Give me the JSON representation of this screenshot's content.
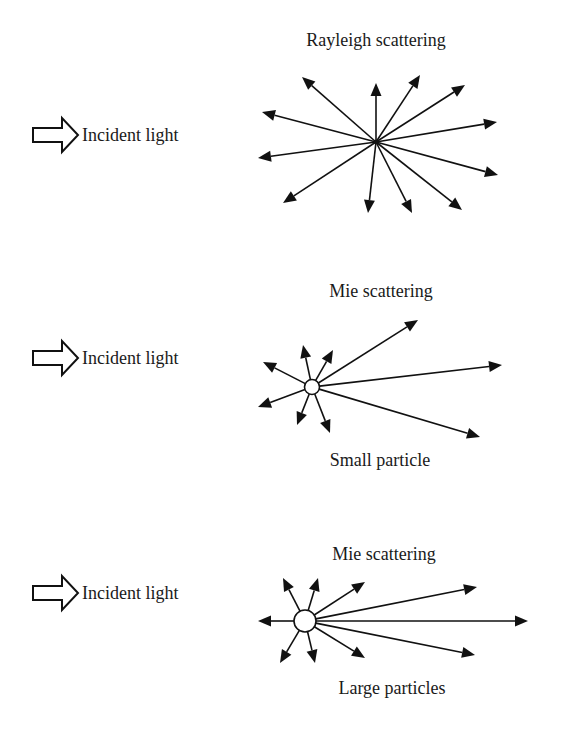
{
  "panels": [
    {
      "id": "rayleigh",
      "title": "Rayleigh scattering",
      "caption": "",
      "incident_label": "Incident light",
      "incident_icon": "hollow-right-arrow-icon",
      "incident_y": 135,
      "title_pos": [
        376,
        46
      ],
      "caption_pos": null,
      "center": [
        376,
        142
      ],
      "particle_radius": 0,
      "arrows": [
        [
          302,
          77
        ],
        [
          376,
          83
        ],
        [
          420,
          75
        ],
        [
          465,
          85
        ],
        [
          262,
          112
        ],
        [
          497,
          122
        ],
        [
          258,
          158
        ],
        [
          498,
          175
        ],
        [
          283,
          203
        ],
        [
          368,
          213
        ],
        [
          412,
          213
        ],
        [
          462,
          210
        ]
      ]
    },
    {
      "id": "mie-small",
      "title": "Mie scattering",
      "caption": "Small particle",
      "incident_label": "Incident light",
      "incident_icon": "hollow-right-arrow-icon",
      "incident_y": 358,
      "title_pos": [
        381,
        297
      ],
      "caption_pos": [
        380,
        466
      ],
      "center": [
        312,
        387
      ],
      "particle_radius": 7.5,
      "arrows": [
        [
          263,
          362
        ],
        [
          303,
          345
        ],
        [
          333,
          350
        ],
        [
          418,
          320
        ],
        [
          502,
          365
        ],
        [
          480,
          437
        ],
        [
          258,
          407
        ],
        [
          297,
          425
        ],
        [
          330,
          433
        ]
      ]
    },
    {
      "id": "mie-large",
      "title": "Mie scattering",
      "caption": "Large particles",
      "incident_label": "Incident light",
      "incident_icon": "hollow-right-arrow-icon",
      "incident_y": 593,
      "title_pos": [
        384,
        560
      ],
      "caption_pos": [
        392,
        694
      ],
      "center": [
        305,
        621
      ],
      "particle_radius": 11,
      "arrows": [
        [
          258,
          621
        ],
        [
          283,
          578
        ],
        [
          318,
          578
        ],
        [
          365,
          582
        ],
        [
          477,
          587
        ],
        [
          528,
          621
        ],
        [
          475,
          655
        ],
        [
          365,
          658
        ],
        [
          315,
          663
        ],
        [
          280,
          663
        ]
      ]
    }
  ]
}
